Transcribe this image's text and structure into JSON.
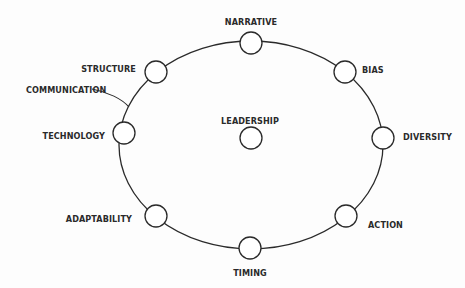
{
  "diagram": {
    "ring_label": "COMMUNICATION",
    "center": {
      "label": "LEADERSHIP"
    },
    "nodes": [
      {
        "id": "narrative",
        "label": "NARRATIVE"
      },
      {
        "id": "bias",
        "label": "BIAS"
      },
      {
        "id": "diversity",
        "label": "DIVERSITY"
      },
      {
        "id": "action",
        "label": "ACTION"
      },
      {
        "id": "timing",
        "label": "TIMING"
      },
      {
        "id": "adaptability",
        "label": "ADAPTABILITY"
      },
      {
        "id": "technology",
        "label": "TECHNOLOGY"
      },
      {
        "id": "structure",
        "label": "STRUCTURE"
      }
    ],
    "colors": {
      "stroke": "#2a2a2a",
      "background": "#fdfdfd"
    }
  }
}
